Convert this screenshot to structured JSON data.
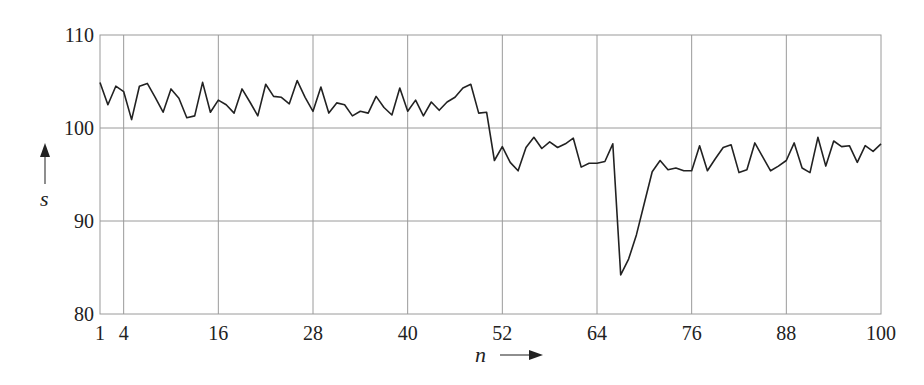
{
  "chart_data": {
    "type": "line",
    "title": "",
    "xlabel": "n",
    "ylabel": "s",
    "xlim": [
      1,
      100
    ],
    "ylim": [
      80,
      110
    ],
    "grid": true,
    "legend": null,
    "x_ticks": [
      1,
      4,
      16,
      28,
      40,
      52,
      64,
      76,
      88,
      100
    ],
    "x_gridlines": [
      4,
      16,
      28,
      40,
      52,
      64,
      76,
      88
    ],
    "y_ticks": [
      80,
      90,
      100,
      110
    ],
    "series": [
      {
        "name": "s",
        "color": "#222222",
        "x": [
          1,
          2,
          3,
          4,
          5,
          6,
          7,
          8,
          9,
          10,
          11,
          12,
          13,
          14,
          15,
          16,
          17,
          18,
          19,
          20,
          21,
          22,
          23,
          24,
          25,
          26,
          27,
          28,
          29,
          30,
          31,
          32,
          33,
          34,
          35,
          36,
          37,
          38,
          39,
          40,
          41,
          42,
          43,
          44,
          45,
          46,
          47,
          48,
          49,
          50,
          51,
          52,
          53,
          54,
          55,
          56,
          57,
          58,
          59,
          60,
          61,
          62,
          63,
          64,
          65,
          66,
          67,
          68,
          69,
          70,
          71,
          72,
          73,
          74,
          75,
          76,
          77,
          78,
          79,
          80,
          81,
          82,
          83,
          84,
          85,
          86,
          87,
          88,
          89,
          90,
          91,
          92,
          93,
          94,
          95,
          96,
          97,
          98,
          99,
          100
        ],
        "values": [
          104.9,
          102.5,
          104.5,
          103.9,
          100.9,
          104.5,
          104.8,
          103.3,
          101.7,
          104.2,
          103.2,
          101.1,
          101.3,
          104.9,
          101.7,
          103.0,
          102.5,
          101.6,
          104.2,
          102.8,
          101.3,
          104.7,
          103.4,
          103.3,
          102.6,
          105.1,
          103.3,
          101.8,
          104.4,
          101.6,
          102.7,
          102.5,
          101.3,
          101.8,
          101.6,
          103.4,
          102.2,
          101.4,
          104.3,
          101.8,
          103.0,
          101.3,
          102.8,
          101.9,
          102.8,
          103.3,
          104.3,
          104.7,
          101.6,
          101.7,
          96.5,
          98.0,
          96.3,
          95.4,
          97.9,
          99.0,
          97.8,
          98.5,
          97.9,
          98.3,
          98.9,
          95.8,
          96.2,
          96.2,
          96.4,
          98.3,
          84.2,
          85.9,
          88.5,
          91.9,
          95.3,
          96.5,
          95.5,
          95.7,
          95.4,
          95.4,
          98.1,
          95.4,
          96.7,
          97.9,
          98.2,
          95.2,
          95.5,
          98.4,
          96.9,
          95.4,
          95.9,
          96.5,
          98.4,
          95.7,
          95.2,
          99.0,
          95.9,
          98.6,
          98.0,
          98.1,
          96.3,
          98.1,
          97.5,
          98.3
        ]
      }
    ]
  },
  "layout": {
    "plot": {
      "left": 100,
      "top": 35,
      "right": 881,
      "bottom": 314
    },
    "gridline_color": "#9a9a9a",
    "line_color": "#222222"
  },
  "labels": {
    "x_axis": "n",
    "y_axis": "s"
  }
}
